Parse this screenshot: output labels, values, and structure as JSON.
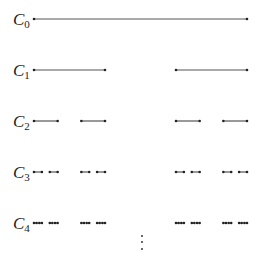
{
  "colors": {
    "line": "#555555",
    "endpoint": "#222222",
    "text": "#222222"
  },
  "geometry": {
    "x_start": 34,
    "x_end": 247,
    "row_y": [
      19,
      70,
      121,
      172,
      223
    ],
    "label_x": 13
  },
  "levels": [
    {
      "symbol": "C",
      "index": "0",
      "n": 0
    },
    {
      "symbol": "C",
      "index": "1",
      "n": 1
    },
    {
      "symbol": "C",
      "index": "2",
      "n": 2
    },
    {
      "symbol": "C",
      "index": "3",
      "n": 3
    },
    {
      "symbol": "C",
      "index": "4",
      "n": 4
    }
  ],
  "continuation": {
    "symbol": "vertical-ellipsis",
    "x": 142,
    "dots_y": [
      236,
      242,
      249
    ]
  }
}
